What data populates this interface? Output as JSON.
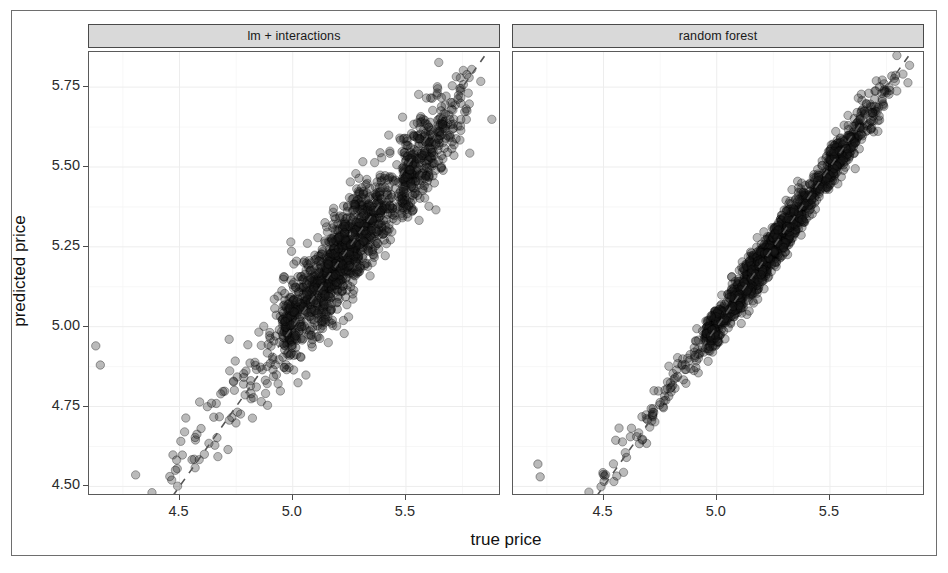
{
  "chart_data": {
    "type": "scatter",
    "title": "",
    "xlabel": "true price",
    "ylabel": "predicted price",
    "xlim": [
      4.1,
      5.92
    ],
    "ylim": [
      4.47,
      5.86
    ],
    "xticks": [
      4.5,
      5.0,
      5.5
    ],
    "xtick_labels": [
      "4.5",
      "5.0",
      "5.5"
    ],
    "yticks": [
      4.5,
      4.75,
      5.0,
      5.25,
      5.5,
      5.75
    ],
    "ytick_labels": [
      "4.50",
      "4.75",
      "5.00",
      "5.25",
      "5.50",
      "5.75"
    ],
    "grid": true,
    "grid_major": true,
    "grid_minor": true,
    "legend": "none",
    "facets": [
      {
        "label": "lm + interactions",
        "n_points": 1600,
        "description": "Predicted vs true price for a linear model with interaction terms; wide scatter band around the identity line with visible spread, especially below true price 5.0.",
        "correlation": 0.93,
        "residual_spread": 0.075,
        "reference_line": {
          "type": "identity",
          "slope": 1,
          "intercept": 0,
          "style": "dashed",
          "color": "#555555"
        },
        "outliers": [
          {
            "x": 4.13,
            "y": 4.94
          },
          {
            "x": 4.15,
            "y": 4.88
          }
        ]
      },
      {
        "label": "random forest",
        "n_points": 1600,
        "description": "Predicted vs true price for a random forest model; much tighter scatter band hugging the identity line with a few low outliers.",
        "correlation": 0.985,
        "residual_spread": 0.032,
        "reference_line": {
          "type": "identity",
          "slope": 1,
          "intercept": 0,
          "style": "dashed",
          "color": "#555555"
        },
        "outliers": [
          {
            "x": 4.21,
            "y": 4.57
          },
          {
            "x": 4.22,
            "y": 4.53
          }
        ]
      }
    ],
    "point_style": {
      "shape": "circle",
      "fill": "#1a1a1a",
      "fill_opacity": 0.3,
      "stroke": "#000000",
      "radius_px": 4.2
    },
    "colors": {
      "strip_background": "#d9d9d9",
      "panel_background": "#ffffff",
      "panel_border": "#5a5a5a",
      "gridline": "#efefef",
      "axis_text": "#2b2b2b",
      "reference_line": "#555555",
      "frame_border": "#6e6e6e"
    }
  },
  "axis": {
    "y_label": "predicted price",
    "x_label": "true price"
  },
  "panels": [
    {
      "strip_label": "lm + interactions"
    },
    {
      "strip_label": "random forest"
    }
  ]
}
